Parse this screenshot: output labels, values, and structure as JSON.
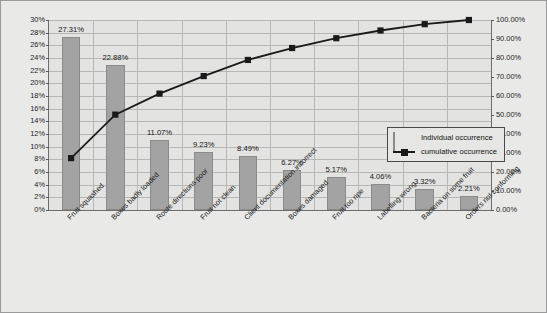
{
  "chart_data": {
    "type": "bar",
    "title": "",
    "subtitle": "",
    "xlabel": "",
    "ylabel": "",
    "categories": [
      "Fruit squashed",
      "Boxes badly loaded",
      "Route directions poor",
      "Fruit not clean",
      "Client documentation incorrect",
      "Boxes damaged",
      "Fruit too ripe",
      "Labelling wrong",
      "Bacteria on some fruit",
      "Orders not conforming"
    ],
    "series": [
      {
        "name": "Individual occurrence",
        "type": "bar",
        "axis": "left",
        "values": [
          27.31,
          22.88,
          11.07,
          9.23,
          8.49,
          6.27,
          5.17,
          4.06,
          3.32,
          2.21
        ],
        "value_labels": [
          "27.31%",
          "22.88%",
          "11.07%",
          "9.23%",
          "8.49%",
          "6.27%",
          "5.17%",
          "4.06%",
          "3.32%",
          "2.21%"
        ],
        "color": "#a3a3a3"
      },
      {
        "name": "cumulative occurrence",
        "type": "line",
        "axis": "right",
        "values": [
          27.31,
          50.19,
          61.26,
          70.49,
          78.98,
          85.25,
          90.42,
          94.48,
          97.8,
          100.0
        ],
        "color": "#1a1a1a",
        "marker": "square"
      }
    ],
    "left_axis": {
      "min": 0,
      "max": 30,
      "step": 2,
      "ticks": [
        "0%",
        "2%",
        "4%",
        "6%",
        "8%",
        "10%",
        "12%",
        "14%",
        "16%",
        "18%",
        "20%",
        "22%",
        "24%",
        "26%",
        "28%",
        "30%"
      ]
    },
    "right_axis": {
      "min": 0,
      "max": 100,
      "step": 10,
      "ticks": [
        "0.00%",
        "10.00%",
        "20.00%",
        "30.00%",
        "40.00%",
        "50.00%",
        "60.00%",
        "70.00%",
        "80.00%",
        "90.00%",
        "100.00%"
      ]
    },
    "grid": true,
    "legend_position": "inside-right",
    "legend": [
      {
        "label": "Individual occurrence",
        "key": "bar-swatch",
        "color": "#a3a3a3"
      },
      {
        "label": "cumulative occurrence",
        "key": "line-square-marker",
        "color": "#1a1a1a"
      }
    ],
    "colors": {
      "bar": "#a3a3a3",
      "line": "#1a1a1a",
      "plot_background": "#e3e3e1",
      "chart_background": "#e9e9e7",
      "gridline": "#b7b7b5",
      "axis": "#6d6d6d"
    }
  }
}
